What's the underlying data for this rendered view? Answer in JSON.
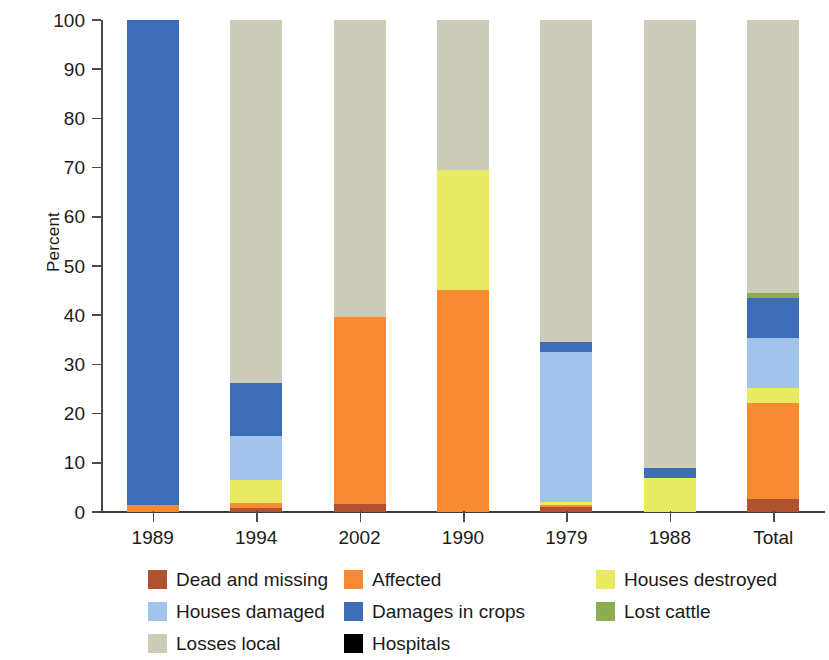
{
  "chart_data": {
    "type": "bar",
    "stacked": true,
    "stack_total": 100,
    "title": "",
    "subtitle": "",
    "xlabel": "",
    "ylabel": "Percent",
    "ylim": [
      0,
      100
    ],
    "yticks": [
      0,
      10,
      20,
      30,
      40,
      50,
      60,
      70,
      80,
      90,
      100
    ],
    "grid": false,
    "legend_position": "bottom",
    "categories": [
      "1989",
      "1994",
      "2002",
      "1990",
      "1979",
      "1988",
      "Total"
    ],
    "series": [
      {
        "name": "Dead and missing",
        "color": "#b0522f",
        "values": [
          0,
          0.8,
          1.6,
          0,
          1.0,
          0,
          2.6
        ]
      },
      {
        "name": "Affected",
        "color": "#f68b33",
        "values": [
          1.5,
          1.0,
          38.0,
          45.2,
          0.4,
          0,
          19.6
        ]
      },
      {
        "name": "Houses destroyed",
        "color": "#e8ea63",
        "values": [
          0,
          4.8,
          0,
          24.3,
          0.6,
          7.0,
          3.0
        ]
      },
      {
        "name": "Houses damaged",
        "color": "#a2c4ea",
        "values": [
          0,
          8.8,
          0,
          0,
          30.5,
          0,
          10.2
        ]
      },
      {
        "name": "Damages in crops",
        "color": "#3d6cb9",
        "values": [
          98.5,
          10.9,
          0,
          0,
          2.0,
          2.0,
          8.2
        ]
      },
      {
        "name": "Lost cattle",
        "color": "#8dad52",
        "values": [
          0,
          0,
          0,
          0,
          0,
          0,
          0.9
        ]
      },
      {
        "name": "Losses local",
        "color": "#ccccb8",
        "values": [
          0,
          73.7,
          60.4,
          30.5,
          65.5,
          91.0,
          55.5
        ]
      },
      {
        "name": "Hospitals",
        "color": "#000000",
        "values": [
          0,
          0,
          0,
          0,
          0,
          0,
          0
        ]
      }
    ]
  },
  "legend": {
    "rows": [
      [
        "Dead and missing",
        "Affected",
        "Houses destroyed"
      ],
      [
        "Houses damaged",
        "Damages in crops",
        "Lost cattle"
      ],
      [
        "Losses local",
        "Hospitals"
      ]
    ]
  }
}
